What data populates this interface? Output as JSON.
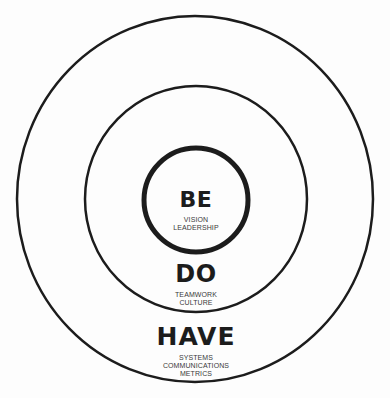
{
  "diagram": {
    "type": "concentric-circles",
    "colors": {
      "background": "#fdfdfd",
      "stroke": "#1c1c1c",
      "title_text": "#1c1c1c",
      "subtitle_text": "#3a3a3a"
    },
    "rings": [
      {
        "level": "inner",
        "title": "BE",
        "items": [
          "VISION",
          "LEADERSHIP"
        ]
      },
      {
        "level": "middle",
        "title": "DO",
        "items": [
          "TEAMWORK",
          "CULTURE"
        ]
      },
      {
        "level": "outer",
        "title": "HAVE",
        "items": [
          "SYSTEMS",
          "COMMUNICATIONS",
          "METRICS"
        ]
      }
    ]
  }
}
